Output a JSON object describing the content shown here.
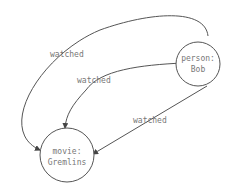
{
  "diagram": {
    "type": "graph",
    "nodes": [
      {
        "id": "bob",
        "line1": "person:",
        "line2": "Bob"
      },
      {
        "id": "gremlins",
        "line1": "movie:",
        "line2": "Gremlins"
      }
    ],
    "edges": [
      {
        "from": "bob",
        "to": "gremlins",
        "label": "watched"
      },
      {
        "from": "bob",
        "to": "gremlins",
        "label": "watched"
      },
      {
        "from": "bob",
        "to": "gremlins",
        "label": "watched"
      }
    ]
  }
}
